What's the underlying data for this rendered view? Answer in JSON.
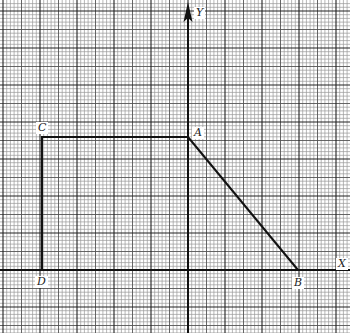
{
  "diagram": {
    "type": "coordinate-plane-graph-paper",
    "axes": {
      "x_label": "X",
      "y_label": "Y",
      "origin_px": [
        188,
        270
      ]
    },
    "grid": {
      "minor_px": 3.7,
      "major_every": 10,
      "medium_every": 5,
      "minor_color": "#9a9a9a",
      "medium_color": "#555555",
      "major_color": "#222222"
    },
    "points": [
      {
        "name": "A",
        "label": "A",
        "px": [
          188,
          137
        ]
      },
      {
        "name": "B",
        "label": "B",
        "px": [
          298,
          270
        ]
      },
      {
        "name": "C",
        "label": "C",
        "px": [
          42,
          137
        ]
      },
      {
        "name": "D",
        "label": "D",
        "px": [
          42,
          270
        ]
      }
    ],
    "segments": [
      {
        "from": "D",
        "to": "C"
      },
      {
        "from": "C",
        "to": "A"
      },
      {
        "from": "A",
        "to": "B"
      }
    ],
    "labels": {
      "A": "A",
      "B": "B",
      "C": "C",
      "D": "D",
      "X": "X",
      "Y": "Y"
    }
  }
}
